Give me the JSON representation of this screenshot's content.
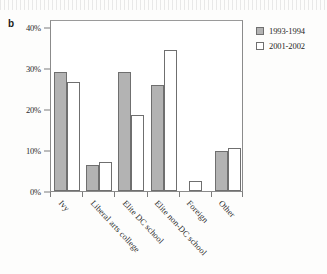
{
  "panel": {
    "label": "b"
  },
  "chart_data": {
    "type": "bar",
    "title": "",
    "xlabel": "",
    "ylabel": "",
    "ylim": [
      0,
      42
    ],
    "ytick_labels": [
      "0%",
      "10%",
      "20%",
      "30%",
      "40%"
    ],
    "ytick_values": [
      0,
      10,
      20,
      30,
      40
    ],
    "grid": false,
    "legend_position": "right-outside",
    "categories": [
      "Ivy",
      "Liberal arts college",
      "Elite DC school",
      "Elite non-DC school",
      "Foreign",
      "Other"
    ],
    "series": [
      {
        "name": "1993-1994",
        "color": "#b3b3b3",
        "values": [
          29.0,
          6.3,
          29.0,
          25.8,
          0.0,
          9.7
        ]
      },
      {
        "name": "2001-2002",
        "color": "#ffffff",
        "values": [
          26.5,
          7.0,
          18.5,
          34.5,
          2.5,
          10.5
        ]
      }
    ]
  }
}
